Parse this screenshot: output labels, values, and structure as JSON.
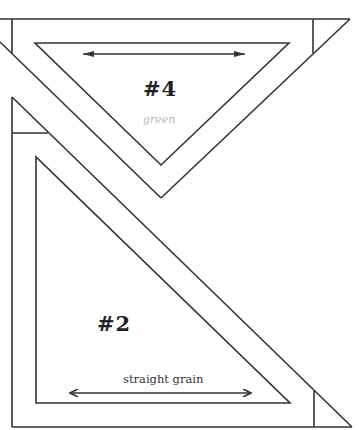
{
  "diagram": {
    "type": "quilt-template-pattern",
    "pieces": [
      {
        "id": "piece-4",
        "label": "#4",
        "note": "green",
        "shape": "inverted triangle",
        "grain_arrow": "horizontal double-headed"
      },
      {
        "id": "piece-2",
        "label": "#2",
        "shape": "right triangle",
        "grain_label": "straight grain",
        "grain_arrow": "horizontal double-headed"
      }
    ],
    "colors": {
      "line": "#333333",
      "background": "#ffffff",
      "handwriting": "#b8b8b8"
    }
  }
}
